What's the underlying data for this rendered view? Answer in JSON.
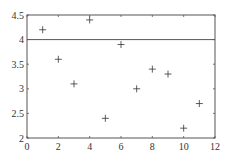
{
  "chart_data": {
    "type": "scatter",
    "title": "",
    "xlabel": "",
    "ylabel": "",
    "xlim": [
      0,
      12
    ],
    "ylim": [
      2,
      4.5
    ],
    "xticks": [
      0,
      2,
      4,
      6,
      8,
      10,
      12
    ],
    "yticks": [
      2,
      2.5,
      3,
      3.5,
      4,
      4.5
    ],
    "xtick_labels": [
      "0",
      "2",
      "4",
      "6",
      "8",
      "10",
      "12"
    ],
    "ytick_labels": [
      "2",
      "2.5",
      "3",
      "3.5",
      "4",
      "4.5"
    ],
    "grid": false,
    "marker": "+",
    "series": [
      {
        "name": "data",
        "x": [
          1,
          2,
          3,
          4,
          5,
          6,
          7,
          8,
          9,
          10,
          11
        ],
        "y": [
          4.2,
          3.6,
          3.1,
          4.4,
          2.4,
          3.9,
          3.0,
          3.4,
          3.3,
          2.2,
          2.7
        ]
      }
    ],
    "hlines": [
      {
        "y": 4.0,
        "label": "reference line"
      }
    ]
  },
  "colors": {
    "axis": "#555555",
    "marker": "#333333",
    "hline": "#555555",
    "background": "#ffffff"
  }
}
